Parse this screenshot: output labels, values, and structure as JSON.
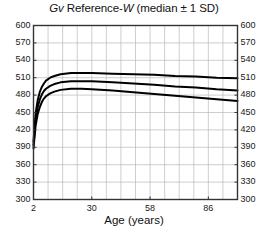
{
  "chart_data": {
    "type": "line",
    "title": "Gv Reference-W (median ± 1 SD)",
    "title_parts": {
      "italic1": "Gv",
      "plain1": " Reference-",
      "italic2": "W",
      "plain2": " (median ± 1 SD)"
    },
    "xlabel": "Age (years)",
    "ylabel": "",
    "xlim": [
      2,
      100
    ],
    "ylim": [
      300,
      600
    ],
    "yticks": [
      600,
      570,
      540,
      510,
      480,
      450,
      420,
      390,
      360,
      330,
      300
    ],
    "ytick_labels": [
      "600",
      "570",
      "540",
      "510",
      "480",
      "450",
      "420",
      "390",
      "360",
      "330",
      "300"
    ],
    "yticks_right": [
      600,
      570,
      540,
      510,
      480,
      450,
      420,
      390,
      360,
      330,
      300
    ],
    "ytick_labels_right": [
      "600",
      "570",
      "540",
      "510",
      "480",
      "450",
      "420",
      "390",
      "360",
      "330",
      "300"
    ],
    "xticks": [
      2,
      30,
      58,
      86
    ],
    "xtick_labels": [
      "2",
      "30",
      "58",
      "86"
    ],
    "grid": true,
    "grid_x_minor_count": 14,
    "legend": "none",
    "line_color": "#000000",
    "grid_color": "#b9b9b9",
    "axis_color": "#333333",
    "series": [
      {
        "name": "+1 SD",
        "x": [
          2,
          3,
          4,
          5,
          6,
          7,
          8,
          10,
          12,
          15,
          20,
          25,
          30,
          40,
          50,
          60,
          70,
          80,
          90,
          100
        ],
        "values": [
          400,
          448,
          471,
          485,
          494,
          500,
          505,
          510,
          513,
          516,
          518,
          518,
          518,
          517,
          516,
          515,
          513,
          512,
          510,
          509
        ]
      },
      {
        "name": "median",
        "x": [
          2,
          3,
          4,
          5,
          6,
          7,
          8,
          10,
          12,
          15,
          20,
          25,
          30,
          40,
          50,
          60,
          70,
          80,
          90,
          100
        ],
        "values": [
          394,
          437,
          459,
          472,
          481,
          487,
          491,
          496,
          499,
          502,
          504,
          504,
          504,
          502,
          500,
          498,
          495,
          493,
          490,
          488
        ]
      },
      {
        "name": "-1 SD",
        "x": [
          2,
          3,
          4,
          5,
          6,
          7,
          8,
          10,
          12,
          15,
          20,
          25,
          30,
          40,
          50,
          60,
          70,
          80,
          90,
          100
        ],
        "values": [
          388,
          427,
          447,
          459,
          468,
          474,
          478,
          483,
          486,
          489,
          491,
          491,
          490,
          488,
          485,
          482,
          479,
          476,
          473,
          470
        ]
      }
    ]
  }
}
